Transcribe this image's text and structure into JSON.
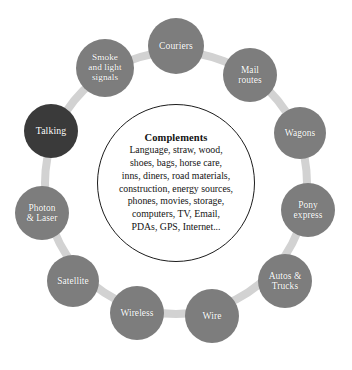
{
  "diagram": {
    "type": "ring-cycle",
    "title": "Complements",
    "background_color": "#ffffff",
    "node_color": "#7d7d7d",
    "node_highlight_color": "#3a3a3a",
    "connector_color": "#d2d2d2",
    "center_outline_color": "#1c1c1c",
    "node_text_color": "#ffffff",
    "center": {
      "title": "Complements",
      "lines": [
        "Language, straw, wood,",
        "shoes, bags, horse care,",
        "inns, diners, road materials,",
        "construction, energy sources,",
        "phones, movies, storage,",
        "computers, TV, Email,",
        "PDAs, GPS, Internet..."
      ]
    },
    "nodes": [
      {
        "label": "Couriers",
        "highlight": false,
        "cx": 176,
        "cy": 46,
        "r": 28,
        "font_size": 9.6
      },
      {
        "label": "Mail\nroutes",
        "highlight": false,
        "cx": 250,
        "cy": 75,
        "r": 27,
        "font_size": 9.4
      },
      {
        "label": "Wagons",
        "highlight": false,
        "cx": 300,
        "cy": 133,
        "r": 26,
        "font_size": 9.4
      },
      {
        "label": "Pony\nexpress",
        "highlight": false,
        "cx": 308,
        "cy": 210,
        "r": 27,
        "font_size": 9.4
      },
      {
        "label": "Autos &\nTrucks",
        "highlight": false,
        "cx": 285,
        "cy": 281,
        "r": 27,
        "font_size": 9.4
      },
      {
        "label": "Wire",
        "highlight": false,
        "cx": 212,
        "cy": 316,
        "r": 27,
        "font_size": 9.6
      },
      {
        "label": "Wireless",
        "highlight": false,
        "cx": 137,
        "cy": 313,
        "r": 27,
        "font_size": 9.4
      },
      {
        "label": "Satellite",
        "highlight": false,
        "cx": 73,
        "cy": 281,
        "r": 26,
        "font_size": 9.4
      },
      {
        "label": "Photon\n& Laser",
        "highlight": false,
        "cx": 42,
        "cy": 213,
        "r": 27,
        "font_size": 9.4
      },
      {
        "label": "Talking",
        "highlight": true,
        "cx": 51,
        "cy": 131,
        "r": 27,
        "font_size": 9.8
      },
      {
        "label": "Smoke\nand light\nsignals",
        "highlight": false,
        "cx": 105,
        "cy": 68,
        "r": 29,
        "font_size": 9.2
      }
    ],
    "center_circle": {
      "cx": 176,
      "cy": 183,
      "r": 79
    },
    "connector_ring": {
      "cx": 176,
      "cy": 183,
      "r": 131,
      "stroke_width": 8
    }
  }
}
